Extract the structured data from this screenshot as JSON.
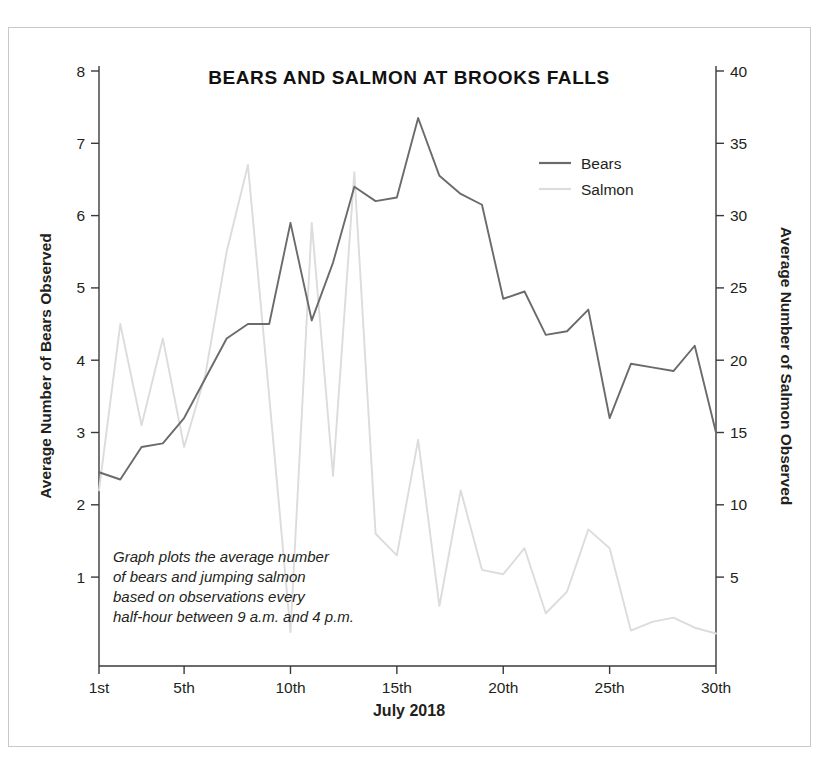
{
  "figure": {
    "title": "BEARS AND SALMON AT BROOKS FALLS",
    "xlabel": "July 2018",
    "left_axis_title": "Average Number of Bears Observed",
    "right_axis_title": "Average Number of Salmon Observed",
    "note_lines": [
      "Graph plots the average number",
      "of bears and jumping salmon",
      "based on observations every",
      "half-hour between 9 a.m. and 4 p.m."
    ],
    "colors": {
      "bears": "#6b6b6b",
      "salmon": "#dcdcdc",
      "axis": "#3a3a3a",
      "text": "#231f20",
      "frame": "#c9c9c9",
      "background": "#ffffff"
    }
  },
  "legend": {
    "position": "top-right",
    "entries": [
      {
        "label": "Bears",
        "color": "#6b6b6b"
      },
      {
        "label": "Salmon",
        "color": "#dcdcdc"
      }
    ]
  },
  "chart_data": {
    "type": "line",
    "title": "BEARS AND SALMON AT BROOKS FALLS",
    "xlabel": "July 2018",
    "ylabel": "Average Number of Bears Observed",
    "y2label": "Average Number of Salmon Observed",
    "grid": false,
    "legend_position": "top-right",
    "x": [
      1,
      2,
      3,
      4,
      5,
      6,
      7,
      8,
      9,
      10,
      11,
      12,
      13,
      14,
      15,
      16,
      17,
      18,
      19,
      20,
      21,
      22,
      23,
      24,
      25,
      26,
      27,
      28,
      29,
      30
    ],
    "xlim": [
      1,
      30
    ],
    "xticks": [
      1,
      5,
      10,
      15,
      20,
      25,
      30
    ],
    "xticklabels": [
      "1st",
      "5th",
      "10th",
      "15th",
      "20th",
      "25th",
      "30th"
    ],
    "ylim": [
      0.18,
      8
    ],
    "yticks": [
      1,
      2,
      3,
      4,
      5,
      6,
      7,
      8
    ],
    "y2lim": [
      0.9,
      40
    ],
    "y2ticks": [
      5,
      10,
      15,
      20,
      25,
      30,
      35,
      40
    ],
    "series": [
      {
        "name": "Bears",
        "axis": "left",
        "color": "#6b6b6b",
        "unit": "average number of bears observed",
        "values": [
          2.45,
          2.35,
          2.8,
          2.85,
          3.2,
          3.75,
          4.3,
          4.5,
          4.5,
          5.9,
          4.55,
          5.35,
          6.4,
          6.2,
          6.25,
          7.35,
          6.55,
          6.3,
          6.15,
          4.85,
          4.95,
          4.35,
          4.4,
          4.7,
          3.2,
          3.95,
          3.9,
          3.85,
          4.2,
          3.0
        ]
      },
      {
        "name": "Salmon",
        "axis": "right",
        "color": "#dcdcdc",
        "unit": "average number of salmon observed",
        "values": [
          11.0,
          22.5,
          15.5,
          21.5,
          14.0,
          19.0,
          27.5,
          33.5,
          17.5,
          1.2,
          29.5,
          12.0,
          33.0,
          8.0,
          6.5,
          14.5,
          3.0,
          11.0,
          5.5,
          5.2,
          7.0,
          2.5,
          4.0,
          8.3,
          7.0,
          1.3,
          1.9,
          2.2,
          1.5,
          1.1
        ]
      }
    ]
  }
}
